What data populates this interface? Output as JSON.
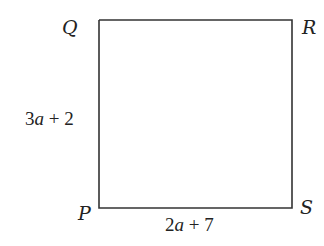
{
  "diagram": {
    "shape": "square",
    "vertices": {
      "Q": {
        "label": "Q",
        "x": 99,
        "y": 20
      },
      "R": {
        "label": "R",
        "x": 292,
        "y": 20
      },
      "P": {
        "label": "P",
        "x": 99,
        "y": 208
      },
      "S": {
        "label": "S",
        "x": 292,
        "y": 208
      }
    },
    "side_labels": {
      "left": {
        "coef": "3",
        "var": "a",
        "rest": " + 2"
      },
      "bottom": {
        "coef": "2",
        "var": "a",
        "rest": " + 7"
      }
    },
    "colors": {
      "stroke": "#333333",
      "text": "#222222"
    }
  }
}
